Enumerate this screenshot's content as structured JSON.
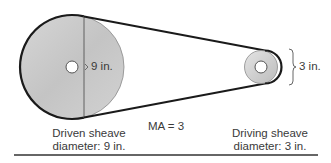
{
  "diagram": {
    "driven_sheave": {
      "size_label": "9 in.",
      "caption_line1": "Driven sheave",
      "caption_line2": "diameter: 9 in."
    },
    "driving_sheave": {
      "size_label": "3 in.",
      "caption_line1": "Driving sheave",
      "caption_line2": "diameter: 3 in."
    },
    "mechanical_advantage": "MA = 3",
    "colors": {
      "belt": "#1a1a1a",
      "sheave_fill_light": "#dcdcdc",
      "sheave_fill_dark": "#bdbdbd",
      "text": "#3a3a3a"
    }
  }
}
